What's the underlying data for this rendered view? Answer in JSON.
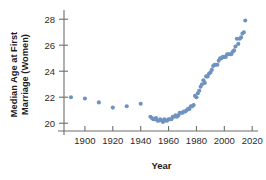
{
  "chart_data": {
    "type": "scatter",
    "title": "",
    "xlabel": "Year",
    "ylabel": "Median Age at First Marriage (Women)",
    "ylabel_lines": [
      "Median Age at First",
      "Marriage (Women)"
    ],
    "xlim": [
      1885,
      2022
    ],
    "ylim": [
      19.4,
      28.4
    ],
    "xticks": [
      1900,
      1920,
      1940,
      1960,
      1980,
      2000,
      2020
    ],
    "xticklabels": [
      "1900",
      "1920",
      "1940",
      "1960",
      "1980",
      "2000",
      "2020"
    ],
    "yticks": [
      20,
      22,
      24,
      26,
      28
    ],
    "yticklabels": [
      "20",
      "22",
      "24",
      "26",
      "28"
    ],
    "grid": false,
    "legend": false,
    "marker_color": "#6f93c0",
    "marker_size": 3.0,
    "axis_color": "#6e6e6e",
    "text_color": "#1c1c1c",
    "background": "#ffffff",
    "series": [
      {
        "name": "Median age at first marriage (women)",
        "x": [
          1890,
          1900,
          1910,
          1920,
          1930,
          1940,
          1947,
          1948,
          1949,
          1950,
          1951,
          1952,
          1953,
          1954,
          1955,
          1956,
          1957,
          1958,
          1959,
          1960,
          1961,
          1962,
          1963,
          1964,
          1965,
          1966,
          1967,
          1968,
          1969,
          1970,
          1971,
          1972,
          1973,
          1974,
          1975,
          1976,
          1977,
          1978,
          1979,
          1980,
          1981,
          1982,
          1983,
          1984,
          1985,
          1986,
          1987,
          1988,
          1989,
          1990,
          1991,
          1992,
          1993,
          1994,
          1995,
          1996,
          1997,
          1998,
          1999,
          2000,
          2001,
          2002,
          2003,
          2004,
          2005,
          2006,
          2007,
          2008,
          2009,
          2010,
          2011,
          2012,
          2013,
          2014,
          2015
        ],
        "y": [
          22.0,
          21.9,
          21.6,
          21.2,
          21.3,
          21.5,
          20.5,
          20.4,
          20.3,
          20.3,
          20.4,
          20.2,
          20.2,
          20.3,
          20.2,
          20.1,
          20.3,
          20.2,
          20.2,
          20.3,
          20.3,
          20.3,
          20.5,
          20.5,
          20.6,
          20.5,
          20.6,
          20.8,
          20.8,
          20.8,
          20.9,
          20.9,
          21.0,
          21.1,
          21.1,
          21.3,
          21.3,
          21.4,
          22.1,
          22.0,
          22.3,
          22.5,
          22.8,
          23.0,
          23.3,
          23.1,
          23.6,
          23.6,
          23.8,
          23.9,
          24.1,
          24.4,
          24.5,
          24.5,
          24.5,
          24.8,
          25.0,
          25.0,
          25.1,
          25.1,
          25.1,
          25.3,
          25.3,
          25.3,
          25.3,
          25.5,
          25.6,
          25.9,
          26.5,
          26.1,
          26.5,
          26.6,
          26.9,
          27.0,
          27.9
        ]
      }
    ]
  }
}
